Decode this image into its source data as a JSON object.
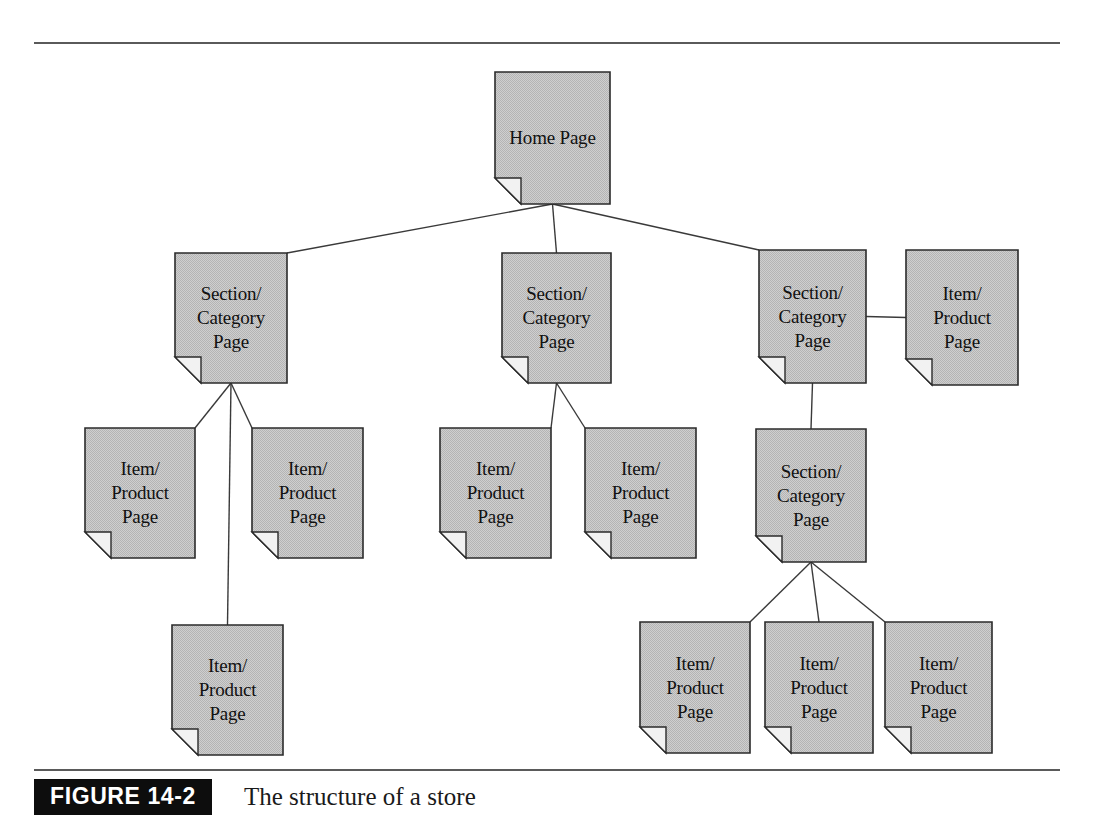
{
  "figure": {
    "badge_label": "FIGURE 14-2",
    "caption": "The structure of a store",
    "badge_bg": "#0d0d0d",
    "badge_fg": "#ffffff"
  },
  "diagram": {
    "title": "The structure of a store",
    "type": "tree-hierarchy",
    "node_fill": "#c6c6c6",
    "node_stroke": "#2b2b2b",
    "connector_color": "#3a3a3a",
    "node_labels": {
      "home": "Home Page",
      "section": "Section/\nCategory\nPage",
      "item": "Item/\nProduct\nPage"
    },
    "nodes": [
      {
        "id": "home",
        "type": "home",
        "lines": [
          "Home Page"
        ],
        "x": 495,
        "y": 72,
        "w": 115,
        "h": 132
      },
      {
        "id": "sec1",
        "type": "section",
        "lines": [
          "Section/",
          "Category",
          "Page"
        ],
        "x": 175,
        "y": 253,
        "w": 112,
        "h": 130
      },
      {
        "id": "sec2",
        "type": "section",
        "lines": [
          "Section/",
          "Category",
          "Page"
        ],
        "x": 502,
        "y": 253,
        "w": 109,
        "h": 130
      },
      {
        "id": "sec3",
        "type": "section",
        "lines": [
          "Section/",
          "Category",
          "Page"
        ],
        "x": 759,
        "y": 250,
        "w": 107,
        "h": 133
      },
      {
        "id": "item_r0",
        "type": "item",
        "lines": [
          "Item/",
          "Product",
          "Page"
        ],
        "x": 906,
        "y": 250,
        "w": 112,
        "h": 135
      },
      {
        "id": "sec4",
        "type": "section",
        "lines": [
          "Section/",
          "Category",
          "Page"
        ],
        "x": 756,
        "y": 429,
        "w": 110,
        "h": 133
      },
      {
        "id": "item_a",
        "type": "item",
        "lines": [
          "Item/",
          "Product",
          "Page"
        ],
        "x": 85,
        "y": 428,
        "w": 110,
        "h": 130
      },
      {
        "id": "item_b",
        "type": "item",
        "lines": [
          "Item/",
          "Product",
          "Page"
        ],
        "x": 252,
        "y": 428,
        "w": 111,
        "h": 130
      },
      {
        "id": "item_c",
        "type": "item",
        "lines": [
          "Item/",
          "Product",
          "Page"
        ],
        "x": 172,
        "y": 625,
        "w": 111,
        "h": 130
      },
      {
        "id": "item_d",
        "type": "item",
        "lines": [
          "Item/",
          "Product",
          "Page"
        ],
        "x": 440,
        "y": 428,
        "w": 111,
        "h": 130
      },
      {
        "id": "item_e",
        "type": "item",
        "lines": [
          "Item/",
          "Product",
          "Page"
        ],
        "x": 585,
        "y": 428,
        "w": 111,
        "h": 130
      },
      {
        "id": "item_f",
        "type": "item",
        "lines": [
          "Item/",
          "Product",
          "Page"
        ],
        "x": 640,
        "y": 622,
        "w": 110,
        "h": 131
      },
      {
        "id": "item_g",
        "type": "item",
        "lines": [
          "Item/",
          "Product",
          "Page"
        ],
        "x": 765,
        "y": 622,
        "w": 108,
        "h": 131
      },
      {
        "id": "item_h",
        "type": "item",
        "lines": [
          "Item/",
          "Product",
          "Page"
        ],
        "x": 885,
        "y": 622,
        "w": 107,
        "h": 131
      }
    ],
    "edges": [
      {
        "from": "home",
        "to": "sec1",
        "kind": "diagonal"
      },
      {
        "from": "home",
        "to": "sec2",
        "kind": "vertical"
      },
      {
        "from": "home",
        "to": "sec3",
        "kind": "diagonal"
      },
      {
        "from": "sec3",
        "to": "item_r0",
        "kind": "horizontal"
      },
      {
        "from": "sec3",
        "to": "sec4",
        "kind": "vertical"
      },
      {
        "from": "sec1",
        "to": "item_a",
        "kind": "diagonal"
      },
      {
        "from": "sec1",
        "to": "item_b",
        "kind": "diagonal"
      },
      {
        "from": "sec1",
        "to": "item_c",
        "kind": "vertical"
      },
      {
        "from": "sec2",
        "to": "item_d",
        "kind": "diagonal"
      },
      {
        "from": "sec2",
        "to": "item_e",
        "kind": "diagonal"
      },
      {
        "from": "sec4",
        "to": "item_f",
        "kind": "diagonal"
      },
      {
        "from": "sec4",
        "to": "item_g",
        "kind": "vertical"
      },
      {
        "from": "sec4",
        "to": "item_h",
        "kind": "diagonal"
      }
    ]
  },
  "rules": {
    "top_rule_y": 43,
    "bottom_rule_y": 770,
    "rule_color": "#5a5a5a"
  }
}
